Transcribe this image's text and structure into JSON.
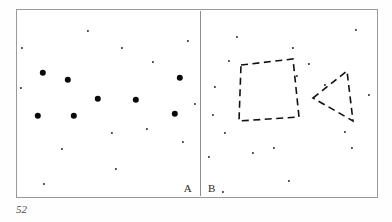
{
  "figure": {
    "page_number": "52",
    "frame_color": "#9a9a9a",
    "divider_color": "#8d8d8d",
    "background_color": "#ffffff",
    "dot_color": "#131313",
    "shape_stroke_color": "#111111"
  },
  "panel_a": {
    "label": "A",
    "description": "Random dot field containing large and small dots",
    "large_dots": [
      {
        "x": 27,
        "y": 64
      },
      {
        "x": 52,
        "y": 71
      },
      {
        "x": 82,
        "y": 90
      },
      {
        "x": 120,
        "y": 91
      },
      {
        "x": 164,
        "y": 69
      },
      {
        "x": 159,
        "y": 105
      },
      {
        "x": 22,
        "y": 107
      },
      {
        "x": 58,
        "y": 107
      }
    ],
    "small_dots": [
      {
        "x": 72,
        "y": 22
      },
      {
        "x": 172,
        "y": 32
      },
      {
        "x": 6,
        "y": 39
      },
      {
        "x": 106,
        "y": 39
      },
      {
        "x": 137,
        "y": 53
      },
      {
        "x": 5,
        "y": 79
      },
      {
        "x": 179,
        "y": 95
      },
      {
        "x": 96,
        "y": 124
      },
      {
        "x": 131,
        "y": 120
      },
      {
        "x": 167,
        "y": 133
      },
      {
        "x": 46,
        "y": 140
      },
      {
        "x": 100,
        "y": 160
      },
      {
        "x": 28,
        "y": 175
      }
    ]
  },
  "panel_b": {
    "label": "B",
    "description": "Random dot field with two superimposed dashed outline shapes",
    "small_dots": [
      {
        "x": 36,
        "y": 28
      },
      {
        "x": 92,
        "y": 39
      },
      {
        "x": 155,
        "y": 21
      },
      {
        "x": 28,
        "y": 52
      },
      {
        "x": 108,
        "y": 55
      },
      {
        "x": 124,
        "y": 76
      },
      {
        "x": 14,
        "y": 78
      },
      {
        "x": 96,
        "y": 67
      },
      {
        "x": 168,
        "y": 86
      },
      {
        "x": 12,
        "y": 106
      },
      {
        "x": 24,
        "y": 124
      },
      {
        "x": 144,
        "y": 123
      },
      {
        "x": 8,
        "y": 148
      },
      {
        "x": 52,
        "y": 144
      },
      {
        "x": 73,
        "y": 139
      },
      {
        "x": 151,
        "y": 139
      },
      {
        "x": 88,
        "y": 172
      },
      {
        "x": 22,
        "y": 183
      }
    ],
    "shapes": [
      {
        "name": "dashed-quadrilateral",
        "kind": "quadrilateral",
        "points": "40,56 92,50 98,108 38,112"
      },
      {
        "name": "dashed-triangle",
        "kind": "triangle",
        "points": "112,89 146,62 152,112"
      }
    ]
  }
}
